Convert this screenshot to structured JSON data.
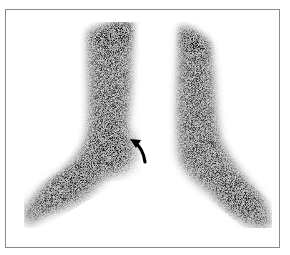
{
  "image": {
    "type": "nuclear-medicine-scintigraphy",
    "description": "Bilateral lower leg and foot radionuclide scan, grayscale, with curved arrow indicating focal uptake at left-image ankle",
    "colors": {
      "background": "#ffffff",
      "uptake": "#111111",
      "frame": "#8a8a8a",
      "arrow": "#000000"
    },
    "annotations": [
      {
        "kind": "curved-arrow",
        "pointing_at": "medial ankle region of left-image limb"
      }
    ]
  }
}
